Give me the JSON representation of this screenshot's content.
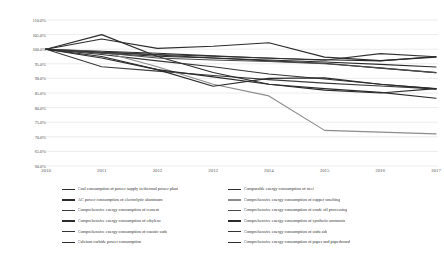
{
  "chart_data": {
    "type": "line",
    "title": "",
    "subtitle": "",
    "xlabel": "",
    "ylabel": "",
    "x": [
      "2010",
      "2011",
      "2012",
      "2013",
      "2014",
      "2015",
      "2016",
      "2017"
    ],
    "xlim": [
      "2010",
      "2017"
    ],
    "ylim": [
      60.0,
      110.0
    ],
    "ytick_step": 5.0,
    "ytick_labels": [
      "110.0%",
      "105.0%",
      "100.0%",
      "95.0%",
      "90.0%",
      "85.0%",
      "80.0%",
      "75.0%",
      "70.0%",
      "65.0%",
      "60.0%"
    ],
    "ytick_values": [
      110.0,
      105.0,
      100.0,
      95.0,
      90.0,
      85.0,
      80.0,
      75.0,
      70.0,
      65.0,
      60.0
    ],
    "grid": true,
    "grid_axis": "y",
    "legend_position": "bottom",
    "legend_columns": 2,
    "value_unit": "%",
    "baseline_note": "All series indexed to 100.0% in 2010",
    "series": [
      {
        "name": "Coal consumption of power supply in thermal power plant",
        "color": "#2b2b2b",
        "values": [
          100.0,
          98.6,
          97.6,
          97.0,
          96.3,
          95.6,
          94.8,
          93.9
        ]
      },
      {
        "name": "AC power consumption of electrolytic aluminum",
        "color": "#2b2b2b",
        "values": [
          100.0,
          99.3,
          98.6,
          97.7,
          96.9,
          96.4,
          96.0,
          97.5
        ]
      },
      {
        "name": "Comprehensive energy consumption of cement",
        "color": "#3a3a3a",
        "values": [
          100.0,
          94.0,
          92.5,
          91.0,
          89.6,
          88.4,
          87.4,
          86.4
        ]
      },
      {
        "name": "Comprehensive energy consumption of ethylene",
        "color": "#2b2b2b",
        "values": [
          100.0,
          105.0,
          97.5,
          92.0,
          88.0,
          86.5,
          85.2,
          83.2
        ]
      },
      {
        "name": "Comprehensive energy consumption of caustic soda",
        "color": "#333333",
        "values": [
          100.0,
          98.2,
          96.0,
          94.0,
          91.5,
          89.8,
          88.0,
          86.5
        ]
      },
      {
        "name": "Calcium carbide power consumption",
        "color": "#2b2b2b",
        "values": [
          100.0,
          99.0,
          98.0,
          97.0,
          96.0,
          95.2,
          93.5,
          92.0
        ]
      },
      {
        "name": "Comparable energy consumption of steel",
        "color": "#2b2b2b",
        "values": [
          100.0,
          103.5,
          100.3,
          101.0,
          102.2,
          97.3,
          96.1,
          97.3
        ]
      },
      {
        "name": "Comprehensive energy consumption of copper smelting",
        "color": "#8c8c8c",
        "values": [
          100.0,
          99.2,
          94.0,
          88.0,
          84.0,
          72.2,
          71.6,
          71.0
        ]
      },
      {
        "name": "Comprehensive energy consumption of crude oil processing",
        "color": "#4a4a4a",
        "values": [
          100.0,
          98.8,
          97.0,
          96.3,
          95.8,
          95.0,
          93.6,
          92.0
        ]
      },
      {
        "name": "Comprehensive energy consumption of synthetic ammonia",
        "color": "#2b2b2b",
        "values": [
          100.0,
          97.5,
          93.0,
          87.3,
          90.0,
          90.2,
          88.0,
          86.4
        ]
      },
      {
        "name": "Comprehensive energy consumption of soda ash",
        "color": "#333333",
        "values": [
          100.0,
          99.0,
          98.2,
          97.6,
          97.0,
          96.2,
          98.5,
          97.4
        ]
      },
      {
        "name": "Comprehensive energy consumption of paper and paperboard",
        "color": "#2b2b2b",
        "values": [
          100.0,
          97.0,
          93.0,
          90.5,
          88.0,
          86.0,
          85.0,
          86.5
        ]
      }
    ]
  }
}
